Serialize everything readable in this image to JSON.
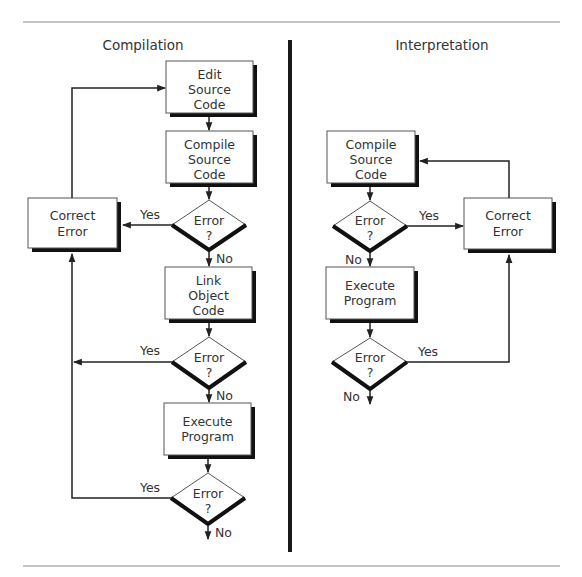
{
  "figure": {
    "colors": {
      "line": "#222222",
      "text": "#333333",
      "box_fill": "#ffffff",
      "box_border": "#555555",
      "shadow": "#111111",
      "rule": "#888888",
      "divider": "#1a1a1a"
    }
  },
  "compilation": {
    "title": "Compilation",
    "nodes": {
      "edit": {
        "line1": "Edit",
        "line2": "Source",
        "line3": "Code"
      },
      "compile": {
        "line1": "Compile",
        "line2": "Source",
        "line3": "Code"
      },
      "decision1": {
        "line1": "Error",
        "line2": "?"
      },
      "link": {
        "line1": "Link",
        "line2": "Object",
        "line3": "Code"
      },
      "decision2": {
        "line1": "Error",
        "line2": "?"
      },
      "execute": {
        "line1": "Execute",
        "line2": "Program"
      },
      "decision3": {
        "line1": "Error",
        "line2": "?"
      },
      "correct": {
        "line1": "Correct",
        "line2": "Error"
      }
    },
    "labels": {
      "yes1": "Yes",
      "no1": "No",
      "yes2": "Yes",
      "no2": "No",
      "yes3": "Yes",
      "no3": "No"
    }
  },
  "interpretation": {
    "title": "Interpretation",
    "nodes": {
      "compile": {
        "line1": "Compile",
        "line2": "Source",
        "line3": "Code"
      },
      "decision1": {
        "line1": "Error",
        "line2": "?"
      },
      "execute": {
        "line1": "Execute",
        "line2": "Program"
      },
      "decision2": {
        "line1": "Error",
        "line2": "?"
      },
      "correct": {
        "line1": "Correct",
        "line2": "Error"
      }
    },
    "labels": {
      "yes1": "Yes",
      "no1": "No",
      "yes2": "Yes",
      "no2": "No"
    }
  }
}
